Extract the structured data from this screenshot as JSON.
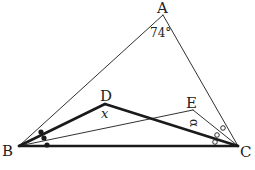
{
  "diagram": {
    "type": "triangle-angle-bisectors",
    "points": {
      "A": {
        "label": "A"
      },
      "B": {
        "label": "B"
      },
      "C": {
        "label": "C"
      },
      "D": {
        "label": "D"
      },
      "E": {
        "label": "E"
      }
    },
    "angle_A_label": "74°",
    "angle_D_label": "x",
    "angle_E_label": "α",
    "segments": [
      {
        "from": "A",
        "to": "B",
        "style": "thin"
      },
      {
        "from": "A",
        "to": "C",
        "style": "thin"
      },
      {
        "from": "B",
        "to": "C",
        "style": "thick"
      },
      {
        "from": "B",
        "to": "D",
        "style": "thick"
      },
      {
        "from": "D",
        "to": "C",
        "style": "thick"
      },
      {
        "from": "B",
        "to": "E",
        "style": "thin"
      },
      {
        "from": "E",
        "to": "C",
        "style": "thin"
      }
    ],
    "angle_B_marks": {
      "count": 3,
      "marker": "filled-dot"
    },
    "angle_C_marks": {
      "count": 3,
      "marker": "open-circle"
    },
    "colors": {
      "line": "#1a1a1a",
      "background": "#ffffff"
    }
  }
}
